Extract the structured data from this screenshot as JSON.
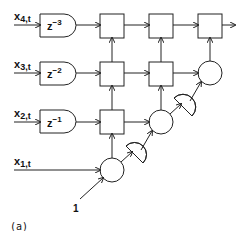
{
  "diagram": {
    "inputs": [
      {
        "var": "x",
        "sub": "4,t"
      },
      {
        "var": "x",
        "sub": "3,t"
      },
      {
        "var": "x",
        "sub": "2,t"
      },
      {
        "var": "x",
        "sub": "1,t"
      }
    ],
    "delays": [
      {
        "base": "z",
        "exp": "−3"
      },
      {
        "base": "z",
        "exp": "−2"
      },
      {
        "base": "z",
        "exp": "−1"
      }
    ],
    "constant_input": "1",
    "caption": "(a)",
    "colors": {
      "stroke": "#222222",
      "background": "#ffffff"
    }
  }
}
